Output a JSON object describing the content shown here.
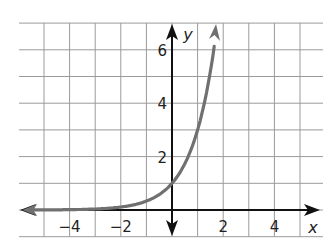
{
  "chart_data": {
    "type": "line",
    "title": "",
    "xlabel": "x",
    "ylabel": "y",
    "xlim": [
      -6,
      5.9
    ],
    "ylim": [
      -1,
      7
    ],
    "grid": true,
    "x_ticks": [
      -4,
      -2,
      2,
      4
    ],
    "y_ticks": [
      2,
      4,
      6
    ],
    "x_tick_labels": [
      "−4",
      "−2",
      "2",
      "4"
    ],
    "y_tick_labels": [
      "2",
      "4",
      "6"
    ],
    "series": [
      {
        "name": "y = 3^x",
        "color": "#707070",
        "x": [
          -5.8,
          -4,
          -3,
          -2,
          -1,
          0,
          0.5,
          1,
          1.3,
          1.6,
          1.75
        ],
        "values": [
          0.002,
          0.012,
          0.037,
          0.111,
          0.333,
          1,
          1.73,
          3,
          4.17,
          5.8,
          6.85
        ]
      }
    ]
  }
}
